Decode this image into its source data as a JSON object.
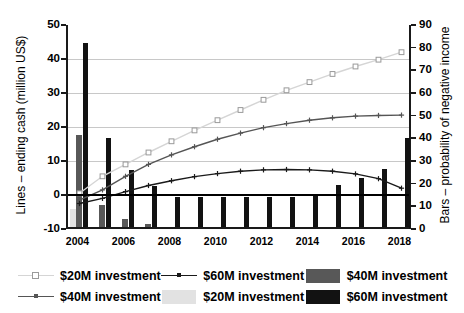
{
  "chart_data": {
    "type": "bar",
    "title": "",
    "xlabel": "",
    "ylabel_left": "Lines – ending cash (million US$)",
    "ylabel_right": "Bars – probability of negative income",
    "x": [
      2004,
      2005,
      2006,
      2007,
      2008,
      2009,
      2010,
      2011,
      2012,
      2013,
      2014,
      2015,
      2016,
      2017,
      2018
    ],
    "xtick_labels": [
      "2004",
      "2006",
      "2008",
      "2010",
      "2012",
      "2014",
      "2016",
      "2018"
    ],
    "xtick_values": [
      2004,
      2006,
      2008,
      2010,
      2012,
      2014,
      2016,
      2018
    ],
    "ylim_left": [
      -10,
      50
    ],
    "ytick_labels_left": [
      "50",
      "40",
      "30",
      "20",
      "10",
      "0",
      "-10"
    ],
    "ytick_values_left": [
      50,
      40,
      30,
      20,
      10,
      0,
      -10
    ],
    "ylim_right": [
      0,
      90
    ],
    "ytick_labels_right": [
      "90",
      "80",
      "70",
      "60",
      "50",
      "40",
      "30",
      "20",
      "10",
      "0"
    ],
    "ytick_values_right": [
      90,
      80,
      70,
      60,
      50,
      40,
      30,
      20,
      10,
      0
    ],
    "grid": true,
    "legend_position": "bottom",
    "bar_series": [
      {
        "name": "$20M investment",
        "axis": "right",
        "color": "#e2e2e2",
        "values": [
          9.0,
          1.0,
          1.0,
          1.0,
          0.8,
          0.8,
          0.8,
          0.8,
          0.8,
          0.8,
          0.8,
          0.8,
          0.8,
          0.8,
          0.8
        ]
      },
      {
        "name": "$40M investment",
        "axis": "right",
        "color": "#585858",
        "values": [
          41.5,
          10.5,
          4.5,
          2.0,
          1.0,
          1.0,
          1.0,
          1.0,
          1.0,
          1.0,
          1.0,
          1.0,
          1.0,
          1.0,
          1.0
        ]
      },
      {
        "name": "$60M investment",
        "axis": "right",
        "color": "#121212",
        "values": [
          82.0,
          40.0,
          26.0,
          19.0,
          14.0,
          14.0,
          14.0,
          14.0,
          14.0,
          14.0,
          14.5,
          19.5,
          22.5,
          26.5,
          40.0
        ]
      }
    ],
    "line_series": [
      {
        "name": "$20M investment",
        "axis": "left",
        "color": "#d5d5d5",
        "marker": "open-square",
        "values": [
          0.5,
          5.5,
          9.0,
          12.5,
          15.8,
          19.0,
          22.0,
          25.0,
          28.0,
          30.8,
          33.2,
          35.6,
          37.8,
          39.8,
          42.0
        ]
      },
      {
        "name": "$40M investment",
        "axis": "left",
        "color": "#555555",
        "marker": "plus",
        "values": [
          -1.5,
          1.5,
          5.5,
          9.0,
          11.8,
          14.2,
          16.4,
          18.2,
          19.8,
          21.0,
          22.0,
          22.7,
          23.2,
          23.4,
          23.5
        ]
      },
      {
        "name": "$60M investment",
        "axis": "left",
        "color": "#1a1a1a",
        "marker": "plus",
        "values": [
          -2.5,
          -1.0,
          1.0,
          2.8,
          4.2,
          5.4,
          6.3,
          7.0,
          7.4,
          7.5,
          7.4,
          7.0,
          6.2,
          4.8,
          2.0
        ]
      }
    ]
  },
  "legend": {
    "items": [
      {
        "label": "$20M investment",
        "kind": "line",
        "marker": "open-square",
        "color": "#d5d5d5"
      },
      {
        "label": "$60M investment",
        "kind": "line",
        "marker": "plus",
        "color": "#1a1a1a"
      },
      {
        "label": "$40M investment",
        "kind": "swatch",
        "color": "#585858"
      },
      {
        "label": "$40M investment",
        "kind": "line",
        "marker": "plus",
        "color": "#555555"
      },
      {
        "label": "$20M investment",
        "kind": "swatch",
        "color": "#e2e2e2"
      },
      {
        "label": "$60M investment",
        "kind": "swatch",
        "color": "#121212"
      }
    ]
  }
}
